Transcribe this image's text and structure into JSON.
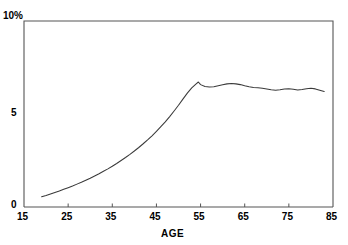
{
  "chart_data": {
    "type": "line",
    "title": "",
    "subtitle": "",
    "xlabel": "AGE",
    "ylabel": "",
    "ylabel_top_annotation": "10%",
    "xlim": [
      15,
      85
    ],
    "ylim": [
      0,
      10
    ],
    "grid": false,
    "legend": null,
    "x_ticks": [
      15,
      25,
      35,
      45,
      55,
      65,
      75,
      85
    ],
    "x_tick_labels": [
      "15",
      "25",
      "35",
      "45",
      "55",
      "65",
      "75",
      "85"
    ],
    "y_ticks": [
      0,
      5,
      10
    ],
    "y_tick_labels": [
      "0",
      "5",
      "10%"
    ],
    "series": [
      {
        "name": "rate",
        "units": "percent",
        "x": [
          19.0,
          20.0,
          21.0,
          22.0,
          23.0,
          24.0,
          25.0,
          26.0,
          27.0,
          28.0,
          29.0,
          30.0,
          31.0,
          32.0,
          33.0,
          34.0,
          35.0,
          36.0,
          37.0,
          38.0,
          39.0,
          40.0,
          41.0,
          42.0,
          43.0,
          44.0,
          45.0,
          46.0,
          47.0,
          48.0,
          49.0,
          50.0,
          51.0,
          52.0,
          53.0,
          54.0,
          54.5,
          55.0,
          56.0,
          57.0,
          58.0,
          59.0,
          60.0,
          61.0,
          62.0,
          63.0,
          64.0,
          65.0,
          66.0,
          67.0,
          68.0,
          69.0,
          70.0,
          71.0,
          72.0,
          73.0,
          74.0,
          75.0,
          76.0,
          77.0,
          78.0,
          79.0,
          80.0,
          81.0,
          82.0,
          83.0
        ],
        "y": [
          0.55,
          0.62,
          0.7,
          0.78,
          0.86,
          0.95,
          1.04,
          1.13,
          1.23,
          1.33,
          1.44,
          1.55,
          1.67,
          1.79,
          1.92,
          2.05,
          2.19,
          2.34,
          2.5,
          2.66,
          2.83,
          3.01,
          3.2,
          3.4,
          3.61,
          3.83,
          4.07,
          4.32,
          4.58,
          4.86,
          5.16,
          5.47,
          5.8,
          6.12,
          6.4,
          6.62,
          6.72,
          6.58,
          6.48,
          6.45,
          6.47,
          6.52,
          6.57,
          6.62,
          6.64,
          6.62,
          6.58,
          6.52,
          6.47,
          6.43,
          6.41,
          6.38,
          6.34,
          6.3,
          6.28,
          6.3,
          6.34,
          6.36,
          6.33,
          6.29,
          6.32,
          6.36,
          6.38,
          6.35,
          6.28,
          6.21
        ]
      }
    ],
    "colors": {
      "line": "#3a3a3a",
      "axis": "#555555",
      "text": "#000000",
      "background": "#ffffff"
    },
    "geometry": {
      "plot_left_px": 24,
      "plot_right_px": 333,
      "plot_top_px": 21,
      "plot_bottom_px": 207
    }
  }
}
